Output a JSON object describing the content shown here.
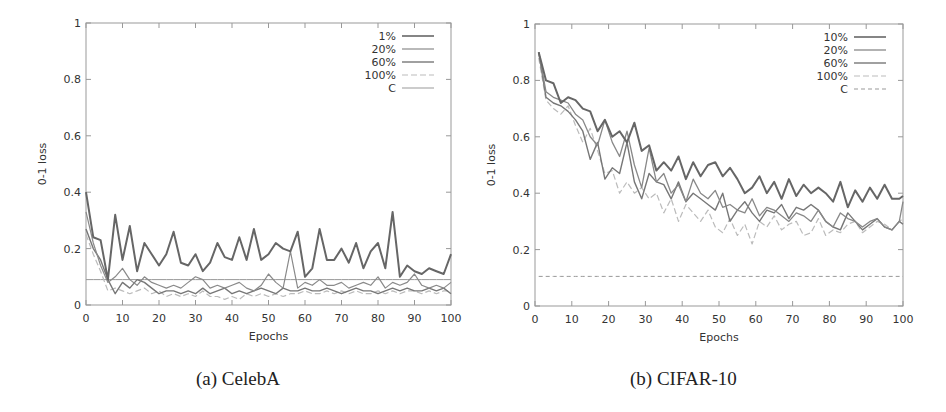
{
  "figure": {
    "captions": [
      "(a) CelebA",
      "(b) CIFAR-10"
    ]
  },
  "chart_data": [
    {
      "type": "line",
      "title": "(a) CelebA",
      "xlabel": "Epochs",
      "ylabel": "0-1 loss",
      "xlim": [
        0,
        100
      ],
      "ylim": [
        0,
        1
      ],
      "xticks": [
        0,
        10,
        20,
        30,
        40,
        50,
        60,
        70,
        80,
        90,
        100
      ],
      "yticks": [
        0,
        0.2,
        0.4,
        0.6,
        0.8,
        1
      ],
      "ytick_labels": [
        "0",
        "0.2",
        "0.4",
        "0.6",
        "0.8",
        "1"
      ],
      "grid": false,
      "legend_position": "top-right",
      "x": [
        0,
        2,
        4,
        6,
        8,
        10,
        12,
        14,
        16,
        18,
        20,
        22,
        24,
        26,
        28,
        30,
        32,
        34,
        36,
        38,
        40,
        42,
        44,
        46,
        48,
        50,
        52,
        54,
        56,
        58,
        60,
        62,
        64,
        66,
        68,
        70,
        72,
        74,
        76,
        78,
        80,
        82,
        84,
        86,
        88,
        90,
        92,
        94,
        96,
        98,
        100
      ],
      "series": [
        {
          "name": "1%",
          "color": "#666666",
          "width": 2.0,
          "dash": "",
          "values": [
            0.4,
            0.24,
            0.23,
            0.09,
            0.32,
            0.16,
            0.28,
            0.12,
            0.22,
            0.18,
            0.14,
            0.18,
            0.26,
            0.15,
            0.14,
            0.18,
            0.12,
            0.15,
            0.22,
            0.17,
            0.16,
            0.24,
            0.16,
            0.27,
            0.16,
            0.18,
            0.22,
            0.2,
            0.19,
            0.26,
            0.1,
            0.13,
            0.27,
            0.16,
            0.16,
            0.2,
            0.15,
            0.22,
            0.13,
            0.19,
            0.22,
            0.13,
            0.33,
            0.1,
            0.14,
            0.12,
            0.11,
            0.13,
            0.12,
            0.11,
            0.18
          ]
        },
        {
          "name": "20%",
          "color": "#8a8a8a",
          "width": 1.2,
          "dash": "",
          "values": [
            0.33,
            0.22,
            0.14,
            0.08,
            0.1,
            0.13,
            0.09,
            0.07,
            0.1,
            0.08,
            0.07,
            0.06,
            0.07,
            0.06,
            0.08,
            0.1,
            0.09,
            0.06,
            0.07,
            0.06,
            0.07,
            0.08,
            0.06,
            0.05,
            0.07,
            0.11,
            0.08,
            0.06,
            0.19,
            0.06,
            0.08,
            0.07,
            0.09,
            0.07,
            0.07,
            0.08,
            0.06,
            0.07,
            0.08,
            0.07,
            0.1,
            0.06,
            0.08,
            0.07,
            0.08,
            0.11,
            0.07,
            0.06,
            0.07,
            0.06,
            0.08
          ]
        },
        {
          "name": "60%",
          "color": "#777777",
          "width": 1.4,
          "dash": "",
          "values": [
            0.27,
            0.2,
            0.16,
            0.09,
            0.04,
            0.08,
            0.06,
            0.09,
            0.08,
            0.06,
            0.04,
            0.05,
            0.05,
            0.04,
            0.05,
            0.04,
            0.06,
            0.04,
            0.05,
            0.06,
            0.04,
            0.05,
            0.04,
            0.05,
            0.06,
            0.05,
            0.04,
            0.06,
            0.05,
            0.05,
            0.06,
            0.05,
            0.05,
            0.06,
            0.05,
            0.04,
            0.05,
            0.06,
            0.05,
            0.05,
            0.04,
            0.05,
            0.06,
            0.05,
            0.06,
            0.05,
            0.05,
            0.06,
            0.05,
            0.06,
            0.04
          ]
        },
        {
          "name": "100%",
          "color": "#bbbbbb",
          "width": 1.2,
          "dash": "6,3",
          "values": [
            0.25,
            0.18,
            0.12,
            0.05,
            0.06,
            0.05,
            0.04,
            0.05,
            0.06,
            0.04,
            0.05,
            0.03,
            0.04,
            0.03,
            0.04,
            0.03,
            0.05,
            0.03,
            0.03,
            0.02,
            0.03,
            0.02,
            0.04,
            0.03,
            0.04,
            0.03,
            0.04,
            0.03,
            0.04,
            0.04,
            0.05,
            0.04,
            0.04,
            0.05,
            0.04,
            0.05,
            0.04,
            0.05,
            0.04,
            0.04,
            0.05,
            0.04,
            0.05,
            0.04,
            0.05,
            0.05,
            0.04,
            0.05,
            0.04,
            0.05,
            0.05
          ]
        },
        {
          "name": "C",
          "color": "#999999",
          "width": 1.0,
          "dash": "",
          "values": [
            0.09,
            0.09,
            0.09,
            0.09,
            0.09,
            0.09,
            0.09,
            0.09,
            0.09,
            0.09,
            0.09,
            0.09,
            0.09,
            0.09,
            0.09,
            0.09,
            0.09,
            0.09,
            0.09,
            0.09,
            0.09,
            0.09,
            0.09,
            0.09,
            0.09,
            0.09,
            0.09,
            0.09,
            0.09,
            0.09,
            0.09,
            0.09,
            0.09,
            0.09,
            0.09,
            0.09,
            0.09,
            0.09,
            0.09,
            0.09,
            0.09,
            0.09,
            0.09,
            0.09,
            0.09,
            0.09,
            0.09,
            0.09,
            0.09,
            0.09,
            0.09
          ]
        }
      ]
    },
    {
      "type": "line",
      "title": "(b) CIFAR-10",
      "xlabel": "Epochs",
      "ylabel": "0-1 loss",
      "xlim": [
        0,
        100
      ],
      "ylim": [
        0,
        1
      ],
      "xticks": [
        0,
        10,
        20,
        30,
        40,
        50,
        60,
        70,
        80,
        90,
        100
      ],
      "yticks": [
        0,
        0.2,
        0.4,
        0.6,
        0.8,
        1
      ],
      "ytick_labels": [
        "0",
        "0.2",
        "0.4",
        "0.6",
        "0.8",
        "1"
      ],
      "grid": false,
      "legend_position": "top-right",
      "x": [
        1,
        3,
        5,
        7,
        9,
        11,
        13,
        15,
        17,
        19,
        21,
        23,
        25,
        27,
        29,
        31,
        33,
        35,
        37,
        39,
        41,
        43,
        45,
        47,
        49,
        51,
        53,
        55,
        57,
        59,
        61,
        63,
        65,
        67,
        69,
        71,
        73,
        75,
        77,
        79,
        81,
        83,
        85,
        87,
        89,
        91,
        93,
        95,
        97,
        99,
        100
      ],
      "series": [
        {
          "name": "10%",
          "color": "#666666",
          "width": 2.0,
          "dash": "",
          "values": [
            0.9,
            0.8,
            0.79,
            0.72,
            0.74,
            0.73,
            0.7,
            0.69,
            0.62,
            0.66,
            0.6,
            0.62,
            0.58,
            0.65,
            0.55,
            0.57,
            0.48,
            0.51,
            0.48,
            0.53,
            0.45,
            0.51,
            0.46,
            0.5,
            0.51,
            0.46,
            0.49,
            0.45,
            0.4,
            0.42,
            0.46,
            0.4,
            0.44,
            0.38,
            0.45,
            0.39,
            0.43,
            0.4,
            0.42,
            0.4,
            0.37,
            0.44,
            0.35,
            0.41,
            0.37,
            0.42,
            0.38,
            0.43,
            0.38,
            0.38,
            0.39
          ]
        },
        {
          "name": "20%",
          "color": "#888888",
          "width": 1.3,
          "dash": "",
          "values": [
            0.9,
            0.76,
            0.74,
            0.73,
            0.72,
            0.68,
            0.66,
            0.6,
            0.57,
            0.66,
            0.58,
            0.53,
            0.62,
            0.5,
            0.42,
            0.56,
            0.44,
            0.47,
            0.4,
            0.43,
            0.37,
            0.45,
            0.4,
            0.38,
            0.41,
            0.35,
            0.36,
            0.34,
            0.33,
            0.38,
            0.32,
            0.35,
            0.34,
            0.32,
            0.3,
            0.33,
            0.32,
            0.3,
            0.34,
            0.3,
            0.28,
            0.33,
            0.31,
            0.3,
            0.28,
            0.3,
            0.31,
            0.28,
            0.27,
            0.3,
            0.37
          ]
        },
        {
          "name": "60%",
          "color": "#777777",
          "width": 1.4,
          "dash": "",
          "values": [
            0.9,
            0.74,
            0.72,
            0.71,
            0.69,
            0.66,
            0.62,
            0.52,
            0.58,
            0.45,
            0.49,
            0.47,
            0.58,
            0.44,
            0.38,
            0.47,
            0.44,
            0.43,
            0.38,
            0.44,
            0.37,
            0.4,
            0.38,
            0.36,
            0.34,
            0.4,
            0.3,
            0.34,
            0.37,
            0.33,
            0.3,
            0.34,
            0.33,
            0.36,
            0.31,
            0.35,
            0.34,
            0.36,
            0.34,
            0.3,
            0.28,
            0.27,
            0.33,
            0.3,
            0.27,
            0.29,
            0.31,
            0.28,
            0.27,
            0.3,
            0.29
          ]
        },
        {
          "name": "100%",
          "color": "#bbbbbb",
          "width": 1.2,
          "dash": "6,3",
          "values": [
            0.88,
            0.73,
            0.7,
            0.68,
            0.71,
            0.64,
            0.58,
            0.63,
            0.55,
            0.47,
            0.48,
            0.4,
            0.44,
            0.4,
            0.42,
            0.38,
            0.4,
            0.33,
            0.38,
            0.3,
            0.36,
            0.33,
            0.3,
            0.34,
            0.28,
            0.26,
            0.31,
            0.25,
            0.29,
            0.22,
            0.3,
            0.28,
            0.32,
            0.27,
            0.29,
            0.3,
            0.25,
            0.26,
            0.31,
            0.25,
            0.27,
            0.26,
            0.29,
            0.3,
            0.26,
            0.28,
            0.3,
            0.29,
            0.27,
            0.3,
            0.31
          ]
        },
        {
          "name": "C",
          "color": "#999999",
          "width": 1.0,
          "dash": "4,3",
          "values": [
            0.105,
            0.105,
            0.105,
            0.105,
            0.105,
            0.105,
            0.105,
            0.105,
            0.105,
            0.105,
            0.105,
            0.105,
            0.105,
            0.105,
            0.105,
            0.105,
            0.105,
            0.105,
            0.105,
            0.105,
            0.105,
            0.105,
            0.105,
            0.105,
            0.105,
            0.105,
            0.105,
            0.105,
            0.105,
            0.105,
            0.105,
            0.105,
            0.105,
            0.105,
            0.105,
            0.105,
            0.105,
            0.105,
            0.105,
            0.105,
            0.105,
            0.105,
            0.105,
            0.105,
            0.105,
            0.105,
            0.105,
            0.105,
            0.105,
            0.105,
            0.105
          ]
        }
      ]
    }
  ]
}
